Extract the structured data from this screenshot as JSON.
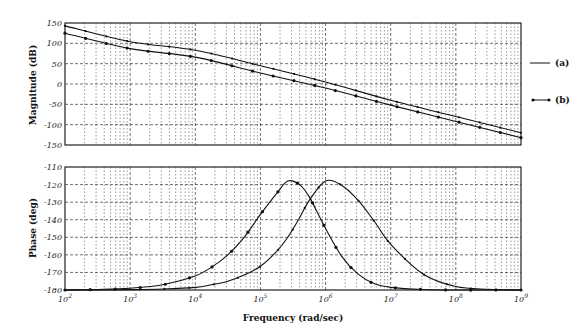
{
  "chart_data": [
    {
      "type": "line",
      "title": "",
      "panel": "magnitude",
      "xlabel": "Frequency (rad/sec)",
      "ylabel": "Magnitude (dB)",
      "xscale": "log",
      "xlim": [
        100,
        1000000000
      ],
      "ylim": [
        -150,
        150
      ],
      "yticks": [
        -150,
        -100,
        -50,
        0,
        50,
        100,
        150
      ],
      "grid": true,
      "x": [
        100,
        1000,
        10000,
        100000,
        1000000,
        10000000,
        100000000,
        1000000000
      ],
      "series": [
        {
          "name": "(a)",
          "values": [
            143,
            104,
            83,
            45,
            5,
            -40,
            -80,
            -120
          ]
        },
        {
          "name": "(b)",
          "values": [
            125,
            87,
            66,
            27,
            -10,
            -52,
            -92,
            -132
          ]
        }
      ]
    },
    {
      "type": "line",
      "title": "",
      "panel": "phase",
      "xlabel": "Frequency (rad/sec)",
      "ylabel": "Phase (deg)",
      "xscale": "log",
      "xlim": [
        100,
        1000000000
      ],
      "ylim": [
        -180,
        -110
      ],
      "yticks": [
        -180,
        -170,
        -160,
        -150,
        -140,
        -130,
        -120,
        -110
      ],
      "xticks": [
        "10^2",
        "10^3",
        "10^4",
        "10^5",
        "10^6",
        "10^7",
        "10^8",
        "10^9"
      ],
      "grid": true,
      "x_log10": [
        2,
        2.5,
        3,
        3.5,
        4,
        4.25,
        4.5,
        4.75,
        5,
        5.25,
        5.42,
        5.6,
        5.75,
        6,
        6.25,
        6.5,
        6.75,
        7,
        7.5,
        8,
        8.5,
        9
      ],
      "series": [
        {
          "name": "(a)",
          "peak_freq": 800000,
          "peak_value": -118,
          "values": [
            -180,
            -180,
            -179.8,
            -179.4,
            -178.5,
            -177,
            -175,
            -171.5,
            -166.5,
            -158,
            -150,
            -139,
            -129,
            -118,
            -120.5,
            -129,
            -141,
            -154,
            -171,
            -178,
            -179.6,
            -180
          ]
        },
        {
          "name": "(b)",
          "peak_freq": 260000,
          "peak_value": -118,
          "values": [
            -180,
            -179.7,
            -179,
            -177,
            -172,
            -167,
            -160,
            -150,
            -137,
            -125,
            -118,
            -120,
            -127,
            -145,
            -161,
            -171,
            -176.5,
            -178.5,
            -179.7,
            -180,
            -180,
            -180
          ]
        }
      ]
    }
  ],
  "legend": {
    "items": [
      {
        "label": "(a)",
        "style": "solid line"
      },
      {
        "label": "(b)",
        "style": "line with dot markers"
      }
    ]
  },
  "axes": {
    "mag_ylabel": "Magnitude (dB)",
    "phase_ylabel": "Phase (deg)",
    "xlabel": "Frequency (rad/sec)"
  }
}
